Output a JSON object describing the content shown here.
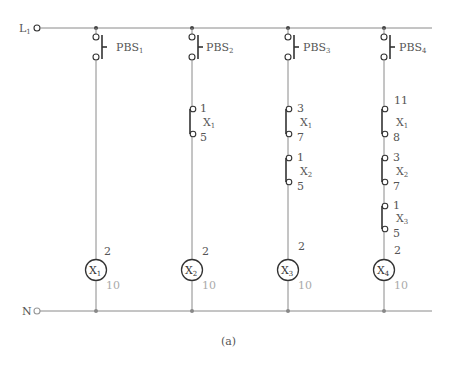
{
  "diagram": {
    "type": "relay-ladder-diagram",
    "caption": "(a)",
    "rails": {
      "top": {
        "label": "L",
        "sub": "1"
      },
      "bottom": {
        "label": "N",
        "sub": ""
      }
    },
    "rungs": [
      {
        "pushbutton": {
          "label": "PBS",
          "sub": "1"
        },
        "contacts": [],
        "coil": {
          "label": "X",
          "sub": "1",
          "top_terminal": "2",
          "bottom_terminal": "10"
        }
      },
      {
        "pushbutton": {
          "label": "PBS",
          "sub": "2"
        },
        "contacts": [
          {
            "relay": "X",
            "sub": "1",
            "top": "1",
            "bottom": "5"
          }
        ],
        "coil": {
          "label": "X",
          "sub": "2",
          "top_terminal": "2",
          "bottom_terminal": "10"
        }
      },
      {
        "pushbutton": {
          "label": "PBS",
          "sub": "3"
        },
        "contacts": [
          {
            "relay": "X",
            "sub": "1",
            "top": "3",
            "bottom": "7"
          },
          {
            "relay": "X",
            "sub": "2",
            "top": "1",
            "bottom": "5"
          }
        ],
        "coil": {
          "label": "X",
          "sub": "3",
          "top_terminal": "2",
          "bottom_terminal": "10"
        }
      },
      {
        "pushbutton": {
          "label": "PBS",
          "sub": "4"
        },
        "contacts": [
          {
            "relay": "X",
            "sub": "1",
            "top": "11",
            "bottom": "8"
          },
          {
            "relay": "X",
            "sub": "2",
            "top": "3",
            "bottom": "7"
          },
          {
            "relay": "X",
            "sub": "3",
            "top": "1",
            "bottom": "5"
          }
        ],
        "coil": {
          "label": "X",
          "sub": "4",
          "top_terminal": "2",
          "bottom_terminal": "10"
        }
      }
    ]
  }
}
